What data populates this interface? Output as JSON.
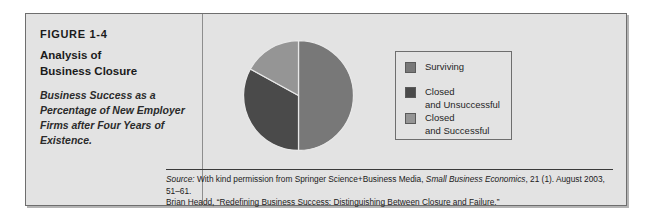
{
  "figure": {
    "number": "FIGURE 1-4",
    "title": "Analysis of\nBusiness Closure",
    "subtitle": "Business Success as a Percentage of New Employer Firms after Four Years of Existence."
  },
  "legend": {
    "items": [
      {
        "label": "Surviving",
        "color": "#787878"
      },
      {
        "label": "Closed\nand Unsuccessful",
        "color": "#4a4a4a"
      },
      {
        "label": "Closed\nand Successful",
        "color": "#959595"
      }
    ]
  },
  "source": {
    "label": "Source:",
    "line1_rest": " With kind permission from Springer Science+Business Media, ",
    "journal": "Small Business Economics",
    "line1_tail": ", 21 (1). August 2003, 51–61.",
    "line2": "Brian Headd, “Redefining Business Success: Distinguishing Between Closure and Failure.”"
  },
  "chart_data": {
    "type": "pie",
    "title": "Analysis of Business Closure",
    "subtitle": "Business Success as a Percentage of New Employer Firms after Four Years of Existence.",
    "labels": [
      "Surviving",
      "Closed and Unsuccessful",
      "Closed and Successful"
    ],
    "values": [
      50,
      33,
      17
    ],
    "unit": "percent",
    "colors": [
      "#787878",
      "#4a4a4a",
      "#959595"
    ],
    "start_angle_deg": 0,
    "direction": "clockwise",
    "legend_position": "right",
    "grid": false
  }
}
